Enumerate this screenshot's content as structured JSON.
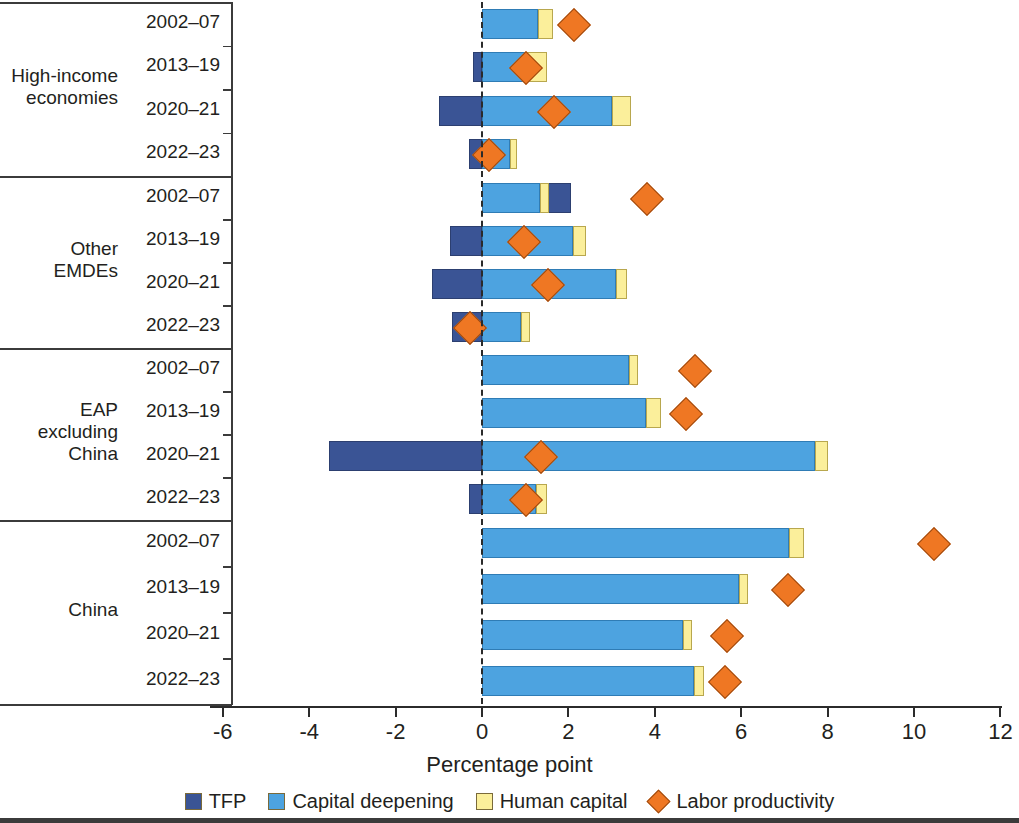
{
  "axis": {
    "xlabel": "Percentage point",
    "ticks": [
      "-6",
      "-4",
      "-2",
      "0",
      "2",
      "4",
      "6",
      "8",
      "10",
      "12"
    ],
    "tick_values": [
      -6,
      -4,
      -2,
      0,
      2,
      4,
      6,
      8,
      10,
      12
    ]
  },
  "legend": [
    {
      "label": "TFP",
      "color": "#3a5495",
      "marker": "square"
    },
    {
      "label": "Capital deepening",
      "color": "#4da3e0",
      "marker": "square"
    },
    {
      "label": "Human capital",
      "color": "#fbef9b",
      "marker": "square"
    },
    {
      "label": "Labor productivity",
      "color": "#ef7723",
      "marker": "diamond"
    }
  ],
  "groups": [
    {
      "name": "High-income\neconomies",
      "periods": [
        "2002–07",
        "2013–19",
        "2020–21",
        "2022–23"
      ]
    },
    {
      "name": "Other\nEMDEs",
      "periods": [
        "2002–07",
        "2013–19",
        "2020–21",
        "2022–23"
      ]
    },
    {
      "name": "EAP\nexcluding\nChina",
      "periods": [
        "2002–07",
        "2013–19",
        "2020–21",
        "2022–23"
      ]
    },
    {
      "name": "China",
      "periods": [
        "2002–07",
        "2013–19",
        "2020–21",
        "2022–23"
      ]
    }
  ],
  "chart_data": {
    "type": "bar",
    "orientation": "horizontal",
    "stacked": true,
    "title": "",
    "xlabel": "Percentage point",
    "ylabel": "",
    "xlim": [
      -7,
      12.5
    ],
    "grid": false,
    "legend_position": "bottom",
    "categories": [
      "High-income economies 2002–07",
      "High-income economies 2013–19",
      "High-income economies 2020–21",
      "High-income economies 2022–23",
      "Other EMDEs 2002–07",
      "Other EMDEs 2013–19",
      "Other EMDEs 2020–21",
      "Other EMDEs 2022–23",
      "EAP excluding China 2002–07",
      "EAP excluding China 2013–19",
      "EAP excluding China 2020–21",
      "EAP excluding China 2022–23",
      "China 2002–07",
      "China 2013–19",
      "China 2020–21",
      "China 2022–23"
    ],
    "series": [
      {
        "name": "TFP",
        "color": "#3a5495",
        "values": [
          0.55,
          -0.2,
          -1.0,
          -0.3,
          2.05,
          -0.75,
          -1.15,
          -0.7,
          1.3,
          0.6,
          -3.55,
          -0.3,
          2.5,
          0.7,
          0.7,
          0.4
        ]
      },
      {
        "name": "Capital deepening",
        "color": "#4da3e0",
        "values": [
          1.3,
          1.05,
          3.0,
          0.65,
          1.35,
          2.1,
          3.1,
          0.9,
          3.4,
          3.8,
          7.7,
          1.25,
          7.1,
          5.95,
          4.65,
          4.9
        ]
      },
      {
        "name": "Human capital",
        "color": "#fbef9b",
        "values": [
          0.35,
          0.45,
          0.45,
          0.15,
          0.2,
          0.3,
          0.25,
          0.2,
          0.2,
          0.35,
          0.3,
          0.25,
          0.35,
          0.2,
          0.2,
          0.25
        ]
      }
    ],
    "marker_series": {
      "name": "Labor productivity",
      "color": "#ef7723",
      "values": [
        2.1,
        1.0,
        1.65,
        0.15,
        3.8,
        0.95,
        1.5,
        -0.3,
        4.9,
        4.7,
        1.35,
        1.0,
        10.45,
        7.05,
        5.65,
        5.6
      ]
    }
  }
}
